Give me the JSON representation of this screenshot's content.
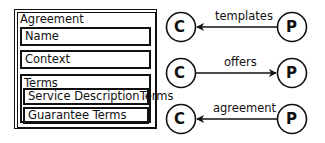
{
  "agreement": {
    "title": "Agreement",
    "sections": {
      "name": "Name",
      "context": "Context",
      "terms": {
        "title": "Terms",
        "items": [
          "Service DescriptionTerms",
          "Guarantee Terms"
        ]
      }
    }
  },
  "relations": [
    {
      "from": "P",
      "to": "C",
      "label": "templates",
      "direction": "P-to-C"
    },
    {
      "from": "C",
      "to": "P",
      "label": "offers",
      "direction": "C-to-P"
    },
    {
      "from": "P",
      "to": "C",
      "label": "agreement",
      "direction": "P-to-C"
    }
  ],
  "nodes": {
    "consumer": "C",
    "provider": "P"
  }
}
